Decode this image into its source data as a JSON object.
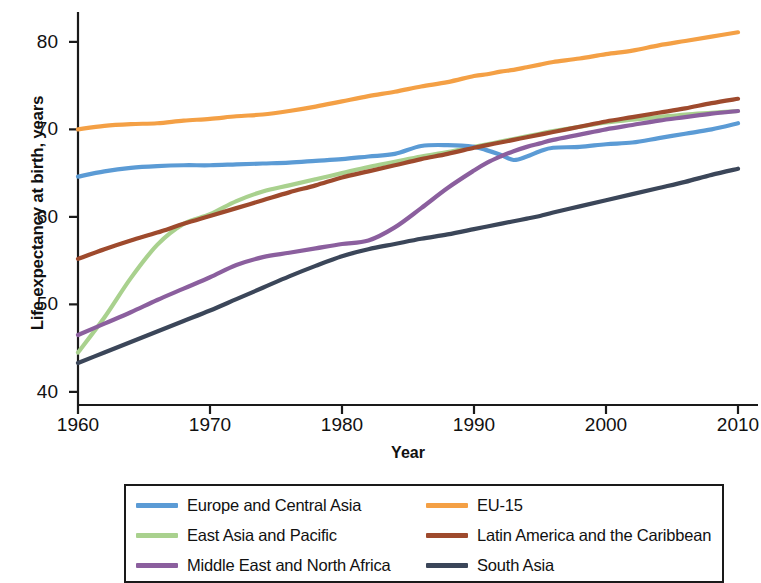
{
  "chart_data": {
    "type": "line",
    "title": "",
    "xlabel": "Year",
    "ylabel": "Life expectancy at birth, years",
    "xlim": [
      1960,
      2010
    ],
    "ylim": [
      38.5,
      82.5
    ],
    "xticks": [
      "1960",
      "1970",
      "1980",
      "1990",
      "2000",
      "2010"
    ],
    "yticks": [
      "40",
      "50",
      "60",
      "70",
      "80"
    ],
    "grid": false,
    "legend_position": "bottom",
    "x": [
      1960,
      1962,
      1964,
      1966,
      1968,
      1970,
      1972,
      1974,
      1976,
      1978,
      1980,
      1982,
      1984,
      1986,
      1988,
      1990,
      1991,
      1992,
      1993,
      1994,
      1995,
      1996,
      1998,
      2000,
      2002,
      2004,
      2006,
      2008,
      2010
    ],
    "series": [
      {
        "name": "Europe and Central Asia",
        "color": "#5b9bd5",
        "values": [
          64.6,
          65.2,
          65.6,
          65.8,
          65.9,
          65.9,
          66.0,
          66.1,
          66.2,
          66.4,
          66.6,
          66.9,
          67.2,
          68.1,
          68.2,
          68.0,
          67.6,
          67.1,
          66.5,
          66.9,
          67.5,
          67.9,
          68.0,
          68.3,
          68.5,
          69.0,
          69.5,
          70.0,
          70.7
        ]
      },
      {
        "name": "EU-15",
        "color": "#f4a045",
        "values": [
          70.0,
          70.4,
          70.6,
          70.7,
          71.0,
          71.2,
          71.5,
          71.7,
          72.1,
          72.6,
          73.2,
          73.8,
          74.3,
          74.9,
          75.4,
          76.1,
          76.3,
          76.6,
          76.8,
          77.1,
          77.4,
          77.7,
          78.1,
          78.6,
          79.0,
          79.6,
          80.1,
          80.6,
          81.1
        ]
      },
      {
        "name": "East Asia and Pacific",
        "color": "#a9d18e",
        "values": [
          44.5,
          48.5,
          53.0,
          56.8,
          59.2,
          60.3,
          61.8,
          62.9,
          63.6,
          64.3,
          65.0,
          65.7,
          66.3,
          66.9,
          67.4,
          68.0,
          68.3,
          68.6,
          68.9,
          69.2,
          69.5,
          69.8,
          70.3,
          70.8,
          71.1,
          71.4,
          71.7,
          71.9,
          72.1
        ]
      },
      {
        "name": "Latin America and the Caribbean",
        "color": "#9e4a2d",
        "values": [
          55.2,
          56.3,
          57.3,
          58.2,
          59.2,
          60.1,
          61.0,
          61.9,
          62.8,
          63.6,
          64.5,
          65.2,
          65.9,
          66.6,
          67.2,
          67.9,
          68.2,
          68.5,
          68.8,
          69.1,
          69.4,
          69.7,
          70.3,
          70.9,
          71.4,
          71.9,
          72.4,
          73.0,
          73.5
        ]
      },
      {
        "name": "Middle East and North Africa",
        "color": "#8b5f9e",
        "values": [
          46.5,
          47.8,
          49.1,
          50.5,
          51.8,
          53.1,
          54.5,
          55.4,
          55.9,
          56.4,
          56.9,
          57.3,
          58.8,
          61.0,
          63.3,
          65.3,
          66.2,
          66.9,
          67.5,
          68.0,
          68.4,
          68.8,
          69.4,
          70.0,
          70.5,
          71.0,
          71.4,
          71.8,
          72.1
        ]
      },
      {
        "name": "South Asia",
        "color": "#3b4659",
        "values": [
          43.3,
          44.5,
          45.7,
          46.9,
          48.1,
          49.3,
          50.6,
          51.9,
          53.2,
          54.4,
          55.5,
          56.3,
          56.9,
          57.5,
          58.0,
          58.6,
          58.9,
          59.2,
          59.5,
          59.8,
          60.1,
          60.5,
          61.2,
          61.9,
          62.6,
          63.3,
          64.0,
          64.8,
          65.5
        ]
      }
    ]
  },
  "legend": {
    "items": [
      {
        "label": "Europe and Central Asia",
        "color": "#5b9bd5"
      },
      {
        "label": "EU-15",
        "color": "#f4a045"
      },
      {
        "label": "East Asia and Pacific",
        "color": "#a9d18e"
      },
      {
        "label": "Latin America and the Caribbean",
        "color": "#9e4a2d"
      },
      {
        "label": "Middle East and North Africa",
        "color": "#8b5f9e"
      },
      {
        "label": "South Asia",
        "color": "#3b4659"
      }
    ]
  },
  "axis": {
    "line_color": "#1a1a1a"
  }
}
